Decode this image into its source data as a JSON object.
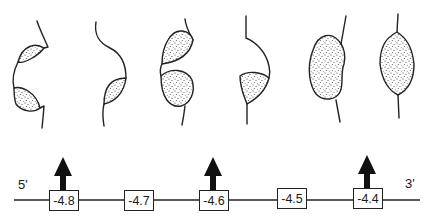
{
  "figure": {
    "type": "schematic strand diagram with bulge/loop structures",
    "strand": {
      "left_end_label": "5'",
      "right_end_label": "3'",
      "line_color": "#222222"
    },
    "positions": [
      {
        "label": "-4.8",
        "arrow": true
      },
      {
        "label": "-4.7",
        "arrow": false
      },
      {
        "label": "-4.6",
        "arrow": true
      },
      {
        "label": "-4.5",
        "arrow": false
      },
      {
        "label": "-4.4",
        "arrow": true
      }
    ],
    "structures": [
      {
        "index": 1,
        "description": "strand with two stippled lobes on left side (upper and lower)"
      },
      {
        "index": 2,
        "description": "curved strand with one stippled lobe lower left"
      },
      {
        "index": 3,
        "description": "strand with two stippled lobes, upper teardrop and lower round"
      },
      {
        "index": 4,
        "description": "curved strand with one stippled lobe at bottom"
      },
      {
        "index": 5,
        "description": "strand with large kidney-shaped stippled lobe"
      },
      {
        "index": 6,
        "description": "strand with large lens-shaped stippled lobe"
      }
    ],
    "colors": {
      "ink": "#222222",
      "stipple": "#333333",
      "background": "#ffffff"
    }
  }
}
